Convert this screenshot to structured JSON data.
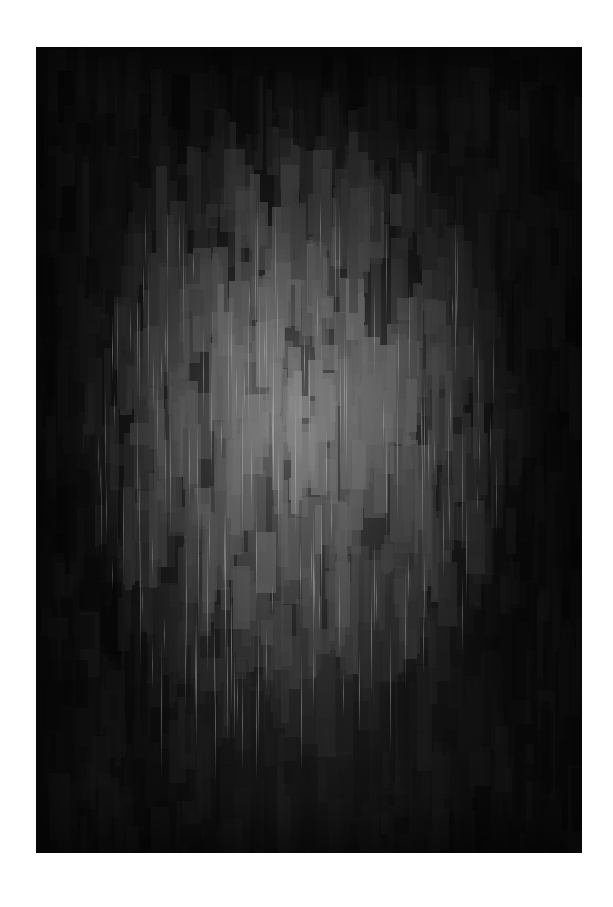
{
  "page": {
    "background": "#ffffff"
  },
  "artwork": {
    "description": "Abstract grayscale mosaic of vertical rectangular strokes with a glowing light-gray center fading to near-black edges",
    "base_color": "#0d0d0d",
    "highlight_color": "#9a9a9a",
    "streak_color": "#c8c8c8",
    "bounds": {
      "x": 36,
      "y": 47,
      "width": 546,
      "height": 806
    },
    "glow_center": {
      "x_pct": 48,
      "y_pct": 46
    }
  }
}
